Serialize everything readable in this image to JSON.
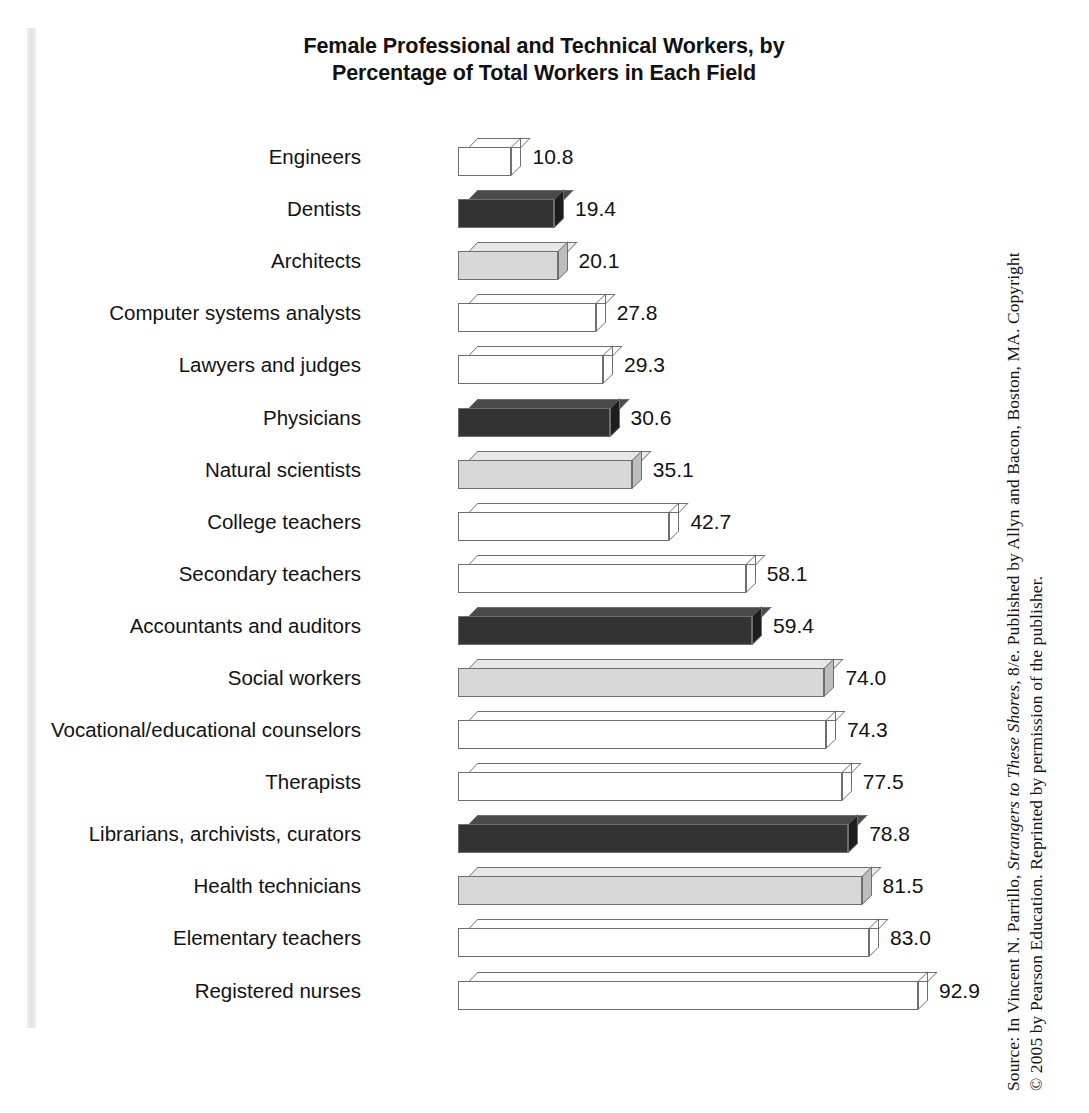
{
  "figure": {
    "title": "Female Professional and Technical Workers, by Percentage of Total Workers in Each Field",
    "title_line1": "Female Professional and Technical Workers, by",
    "title_line2": "Percentage of Total Workers in Each Field",
    "source_line1_pre": "Source: In Vincent N. Parrillo, ",
    "source_line1_italic": "Strangers to These Shores",
    "source_line1_post": ", 8/e. Published by Allyn and Bacon, Boston, MA. Copyright",
    "source_line2": "© 2005 by Pearson Education. Reprinted by permission of the publisher."
  },
  "colors": {
    "medium": "#9a9a9a",
    "dark": "#333333",
    "light": "#d8d8d8",
    "edge": "#6e6e6e",
    "text": "#121212",
    "background": "#ffffff",
    "gutter": "#e6e6e6"
  },
  "chart_data": {
    "type": "bar",
    "orientation": "horizontal",
    "title": "Female Professional and Technical Workers, by Percentage of Total Workers in Each Field",
    "xlabel": "",
    "ylabel": "",
    "xlim": [
      0,
      92.9
    ],
    "grid": false,
    "legend": "none",
    "value_labels": true,
    "categories": [
      "Engineers",
      "Dentists",
      "Architects",
      "Computer systems analysts",
      "Lawyers and judges",
      "Physicians",
      "Natural scientists",
      "College teachers",
      "Secondary teachers",
      "Accountants and auditors",
      "Social workers",
      "Vocational/educational counselors",
      "Therapists",
      "Librarians, archivists, curators",
      "Health technicians",
      "Elementary teachers",
      "Registered nurses"
    ],
    "values": [
      10.8,
      19.4,
      20.1,
      27.8,
      29.3,
      30.6,
      35.1,
      42.7,
      58.1,
      59.4,
      74.0,
      74.3,
      77.5,
      78.8,
      81.5,
      83.0,
      92.9
    ],
    "value_labels_text": [
      "10.8",
      "19.4",
      "20.1",
      "27.8",
      "29.3",
      "30.6",
      "35.1",
      "42.7",
      "58.1",
      "59.4",
      "74.0",
      "74.3",
      "77.5",
      "78.8",
      "81.5",
      "83.0",
      "92.9"
    ],
    "bar_shades": [
      "medium",
      "dark",
      "light",
      "medium",
      "medium",
      "dark",
      "light",
      "medium",
      "medium",
      "dark",
      "light",
      "medium",
      "medium",
      "dark",
      "light",
      "medium",
      "medium"
    ]
  }
}
